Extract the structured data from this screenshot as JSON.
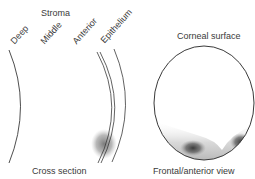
{
  "diagram": {
    "cross_section": {
      "group_label": "Stroma",
      "layers": [
        {
          "label": "Deep"
        },
        {
          "label": "Middle"
        },
        {
          "label": "Anterior"
        },
        {
          "label": "Epithelium"
        }
      ],
      "caption": "Cross section"
    },
    "frontal_view": {
      "top_label": "Corneal surface",
      "caption": "Frontal/anterior view"
    },
    "colors": {
      "line": "#3a3a3a",
      "opacity_shading": "#8a8a8a",
      "dense_spot": "#2e2e2e",
      "text": "#3a3a3a"
    }
  }
}
